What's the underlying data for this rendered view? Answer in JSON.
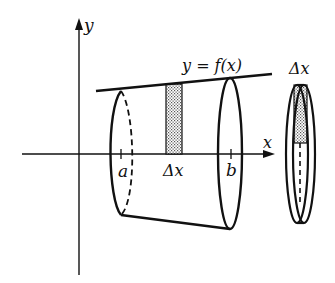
{
  "diagram": {
    "type": "solid-of-revolution",
    "axes": {
      "y_label": "y",
      "x_label": "x"
    },
    "curve_label": "y = f(x)",
    "bounds": {
      "left_label": "a",
      "right_label": "b"
    },
    "strip_label": "Δx",
    "disk_label": "Δx",
    "colors": {
      "stroke": "#111111",
      "shading": "#bdbdbd",
      "background": "#ffffff"
    }
  }
}
